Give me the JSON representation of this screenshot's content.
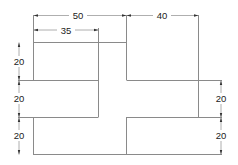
{
  "drawing": {
    "type": "technical-drawing",
    "line_color": "#8a8a8a",
    "text_color": "#222222",
    "dimensions": {
      "top_width_total": "50",
      "top_width_inner": "35",
      "top_right_width": "40",
      "left_h1": "20",
      "left_h2": "20",
      "left_h3": "20",
      "right_h1": "20",
      "right_h2": "20"
    }
  }
}
